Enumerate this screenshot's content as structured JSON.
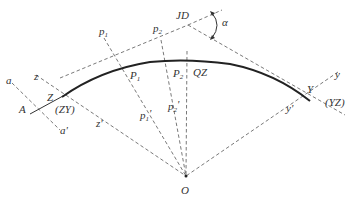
{
  "diagram": {
    "type": "circular-curve-geometry",
    "labels": {
      "JD": "JD",
      "alpha": "α",
      "p1_top": "p",
      "p1_top_sub": "1",
      "p2_top": "p",
      "p2_top_sub": "2",
      "P1": "P",
      "P1_sub": "1",
      "P2": "P",
      "P2_sub": "2",
      "QZ": "QZ",
      "Y": "Y",
      "y_top": "y",
      "YZ": "(YZ)",
      "y_prime": "y'",
      "a": "a",
      "z": "z",
      "Z": "Z",
      "A": "A",
      "ZY": "(ZY)",
      "a_prime": "a'",
      "z_prime": "z'",
      "p1_prime": "p",
      "p1_prime_sub": "1",
      "p2_prime": "p",
      "p2_prime_sub": "2",
      "O": "O"
    },
    "colors": {
      "curve": "#222222",
      "dashed": "#6a6a6a",
      "text": "#333333"
    }
  }
}
